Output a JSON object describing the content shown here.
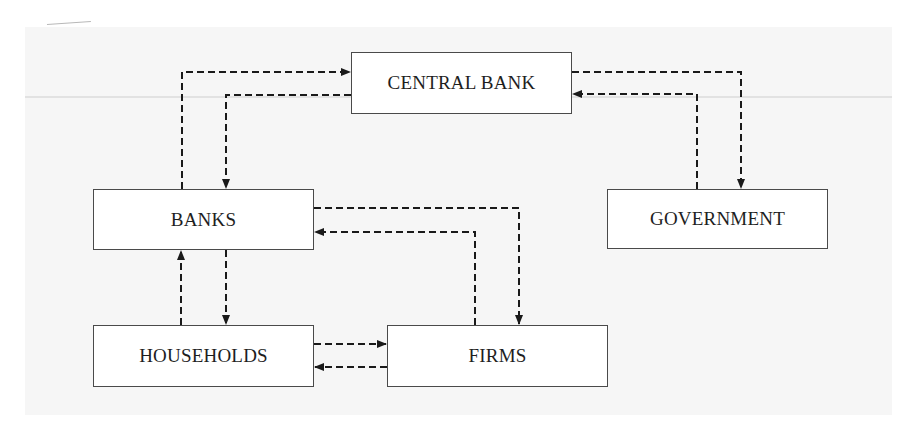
{
  "diagram": {
    "type": "flow-diagram",
    "line_style": "dashed",
    "colors": {
      "background": "#f6f6f6",
      "box_fill": "#ffffff",
      "box_border": "#4a4a4a",
      "line": "#1a1a1a",
      "text": "#1e1e1e"
    },
    "nodes": [
      {
        "id": "central_bank",
        "label": "CENTRAL BANK"
      },
      {
        "id": "banks",
        "label": "BANKS"
      },
      {
        "id": "government",
        "label": "GOVERNMENT"
      },
      {
        "id": "households",
        "label": "HOUSEHOLDS"
      },
      {
        "id": "firms",
        "label": "FIRMS"
      }
    ],
    "edges": [
      {
        "from": "banks",
        "to": "central_bank"
      },
      {
        "from": "central_bank",
        "to": "banks"
      },
      {
        "from": "central_bank",
        "to": "government"
      },
      {
        "from": "government",
        "to": "central_bank"
      },
      {
        "from": "banks",
        "to": "firms"
      },
      {
        "from": "firms",
        "to": "banks"
      },
      {
        "from": "households",
        "to": "banks"
      },
      {
        "from": "banks",
        "to": "households"
      },
      {
        "from": "households",
        "to": "firms"
      },
      {
        "from": "firms",
        "to": "households"
      }
    ]
  }
}
